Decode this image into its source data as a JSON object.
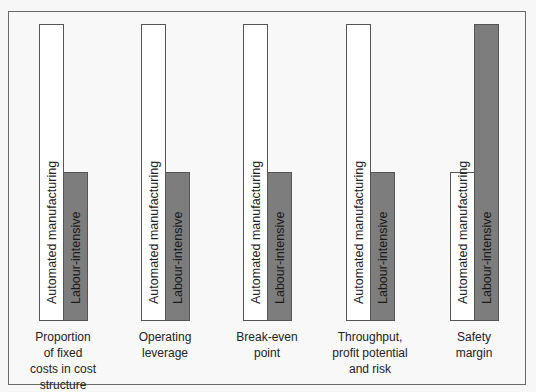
{
  "title": "",
  "groups": [
    {
      "caption": "Proportion of fixed costs in cost structure",
      "caption_lines": [
        "Proportion",
        "of fixed",
        "costs in cost",
        "structure"
      ],
      "automated_label": "Automated manufacturing",
      "labour_label": "Labour-intensive",
      "automated_level": "high",
      "labour_level": "low"
    },
    {
      "caption": "Operating leverage",
      "caption_lines": [
        "Operating",
        "leverage"
      ],
      "automated_label": "Automated manufacturing",
      "labour_label": "Labour-intensive",
      "automated_level": "high",
      "labour_level": "low"
    },
    {
      "caption": "Break-even point",
      "caption_lines": [
        "Break-even",
        "point"
      ],
      "automated_label": "Automated manufacturing",
      "labour_label": "Labour-intensive",
      "automated_level": "high",
      "labour_level": "low"
    },
    {
      "caption": "Throughput, profit potential and risk",
      "caption_lines": [
        "Throughput,",
        "profit potential",
        "and risk"
      ],
      "automated_label": "Automated manufacturing",
      "labour_label": "Labour-intensive",
      "automated_level": "high",
      "labour_level": "low"
    },
    {
      "caption": "Safety margin",
      "caption_lines": [
        "Safety",
        "margin"
      ],
      "automated_label": "Automated manufacturing",
      "labour_label": "Labour-intensive",
      "automated_level": "low",
      "labour_level": "high"
    }
  ],
  "colors": {
    "automated_bar": "#ffffff",
    "labour_bar": "#7d7d7d",
    "border": "#555555",
    "background": "#f8f8f8"
  }
}
